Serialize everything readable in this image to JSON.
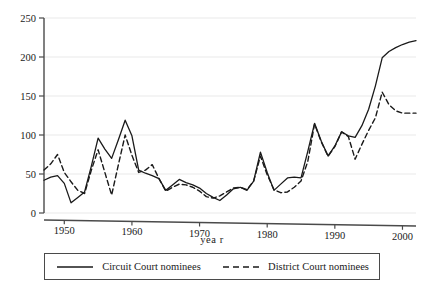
{
  "chart_data": {
    "type": "line",
    "title": "",
    "xlabel": "yea r",
    "ylabel": "",
    "xlim": [
      1947,
      2002
    ],
    "ylim": [
      0,
      250
    ],
    "grid": true,
    "grid_axis": "y",
    "legend_position": "below",
    "xticks": [
      1950,
      1960,
      1970,
      1980,
      1990,
      2000
    ],
    "yticks": [
      0,
      50,
      100,
      150,
      200,
      250
    ],
    "x": [
      1947,
      1948,
      1949,
      1950,
      1951,
      1952,
      1953,
      1954,
      1955,
      1956,
      1957,
      1958,
      1959,
      1960,
      1961,
      1962,
      1963,
      1964,
      1965,
      1966,
      1967,
      1968,
      1969,
      1970,
      1971,
      1972,
      1973,
      1974,
      1975,
      1976,
      1977,
      1978,
      1979,
      1980,
      1981,
      1982,
      1983,
      1984,
      1985,
      1986,
      1987,
      1988,
      1989,
      1990,
      1991,
      1992,
      1993,
      1994,
      1995,
      1996,
      1997,
      1998,
      1999,
      2000,
      2001,
      2002
    ],
    "series": [
      {
        "name": "Circuit Court nominees",
        "style": "solid",
        "color": "#1a1a1a",
        "values": [
          42,
          46,
          48,
          38,
          13,
          20,
          27,
          60,
          96,
          82,
          70,
          94,
          119,
          99,
          55,
          51,
          48,
          44,
          29,
          36,
          43,
          39,
          36,
          32,
          25,
          20,
          16,
          23,
          31,
          33,
          29,
          41,
          78,
          52,
          29,
          37,
          45,
          46,
          45,
          79,
          115,
          92,
          73,
          86,
          104,
          99,
          97,
          112,
          133,
          163,
          199,
          207,
          212,
          216,
          219,
          221
        ]
      },
      {
        "name": "District Court nominees",
        "style": "dashed",
        "color": "#1a1a1a",
        "values": [
          55,
          63,
          75,
          52,
          40,
          29,
          25,
          55,
          81,
          52,
          23,
          62,
          100,
          74,
          52,
          55,
          62,
          44,
          28,
          33,
          37,
          36,
          33,
          28,
          21,
          19,
          22,
          27,
          32,
          33,
          30,
          41,
          73,
          49,
          30,
          26,
          27,
          33,
          41,
          66,
          114,
          91,
          73,
          85,
          104,
          98,
          69,
          88,
          106,
          122,
          155,
          139,
          131,
          128,
          128,
          128
        ]
      }
    ]
  },
  "axis": {
    "x_title": "yea r",
    "y_tick_labels": [
      "0",
      "50",
      "100",
      "150",
      "200",
      "250"
    ],
    "x_tick_labels": [
      "1950",
      "1960",
      "1970",
      "1980",
      "1990",
      "2000"
    ]
  },
  "legend": {
    "entries": [
      {
        "label": "Circuit Court nominees",
        "style": "solid"
      },
      {
        "label": "District Court nominees",
        "style": "dashed"
      }
    ]
  }
}
